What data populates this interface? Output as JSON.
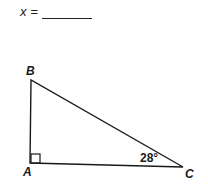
{
  "answer": {
    "variable": "x",
    "equals": "=",
    "blank": ""
  },
  "triangle": {
    "vertices": [
      {
        "label": "A",
        "x": 30,
        "y": 163
      },
      {
        "label": "B",
        "x": 31,
        "y": 80
      },
      {
        "label": "C",
        "x": 183,
        "y": 167
      }
    ],
    "right_angle_at": "A",
    "angle_C": "28°",
    "stroke_color": "#1a1a1a"
  }
}
